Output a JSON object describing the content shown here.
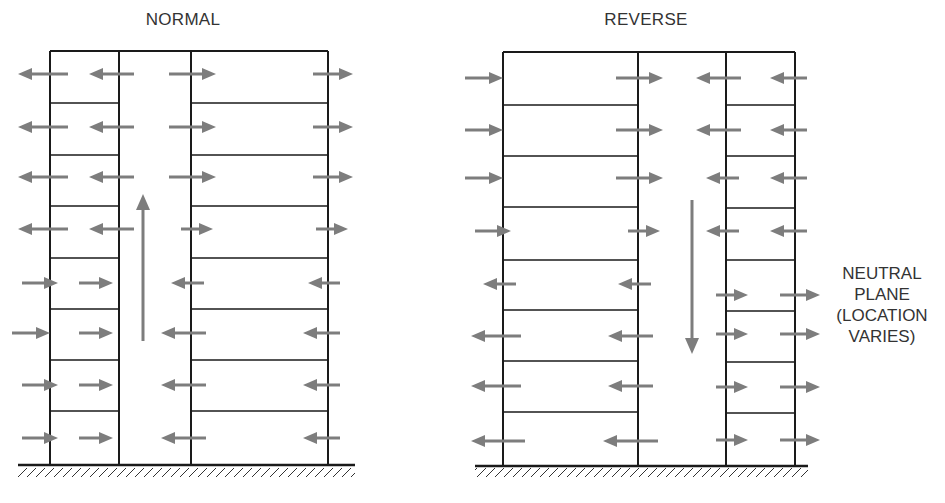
{
  "diagrams": [
    {
      "title": "NORMAL",
      "title_x": 183,
      "title_y": 10,
      "top": 51,
      "ground": 465,
      "ground_x1": 18,
      "ground_x2": 355,
      "sections": [
        {
          "x1": 50,
          "x2": 119,
          "floors": [
            103,
            155,
            206,
            258,
            309,
            360,
            411
          ]
        },
        {
          "x1": 191,
          "x2": 328,
          "floors": [
            103,
            155,
            206,
            258,
            309,
            360,
            411
          ]
        }
      ],
      "top_span": [
        50,
        328
      ],
      "shaft_arrow": {
        "x": 143,
        "y_from": 341,
        "y_to": 194,
        "direction": "up"
      },
      "arrows": [
        {
          "y": 74,
          "wx": 50,
          "dir": "out-left"
        },
        {
          "y": 74,
          "wx": 119,
          "dir": "left"
        },
        {
          "y": 74,
          "wx": 191,
          "dir": "right"
        },
        {
          "y": 74,
          "wx": 328,
          "dir": "out-right"
        },
        {
          "y": 127,
          "wx": 50,
          "dir": "out-left"
        },
        {
          "y": 127,
          "wx": 119,
          "dir": "left"
        },
        {
          "y": 127,
          "wx": 191,
          "dir": "right"
        },
        {
          "y": 127,
          "wx": 328,
          "dir": "out-right"
        },
        {
          "y": 177,
          "wx": 50,
          "dir": "out-left"
        },
        {
          "y": 177,
          "wx": 119,
          "dir": "left"
        },
        {
          "y": 177,
          "wx": 191,
          "dir": "right"
        },
        {
          "y": 177,
          "wx": 328,
          "dir": "out-right"
        },
        {
          "y": 229,
          "wx": 50,
          "dir": "out-left"
        },
        {
          "y": 229,
          "wx": 119,
          "dir": "left"
        },
        {
          "y": 229,
          "wx": 191,
          "dir": "right-short"
        },
        {
          "y": 229,
          "wx": 328,
          "dir": "out-right-short"
        },
        {
          "y": 283,
          "wx": 50,
          "dir": "in-right-short"
        },
        {
          "y": 283,
          "wx": 119,
          "dir": "in-right-inner"
        },
        {
          "y": 283,
          "wx": 191,
          "dir": "left-short"
        },
        {
          "y": 283,
          "wx": 328,
          "dir": "in-left-short"
        },
        {
          "y": 333,
          "wx": 50,
          "dir": "in-right"
        },
        {
          "y": 333,
          "wx": 119,
          "dir": "in-right-inner"
        },
        {
          "y": 333,
          "wx": 191,
          "dir": "left"
        },
        {
          "y": 333,
          "wx": 328,
          "dir": "in-left"
        },
        {
          "y": 385,
          "wx": 50,
          "dir": "in-right-short"
        },
        {
          "y": 385,
          "wx": 119,
          "dir": "in-right-inner"
        },
        {
          "y": 385,
          "wx": 191,
          "dir": "left"
        },
        {
          "y": 385,
          "wx": 328,
          "dir": "in-left"
        },
        {
          "y": 438,
          "wx": 50,
          "dir": "in-right-short"
        },
        {
          "y": 438,
          "wx": 119,
          "dir": "in-right-inner"
        },
        {
          "y": 438,
          "wx": 191,
          "dir": "left"
        },
        {
          "y": 438,
          "wx": 328,
          "dir": "in-left"
        }
      ]
    },
    {
      "title": "REVERSE",
      "title_x": 646,
      "title_y": 10,
      "top": 52,
      "ground": 466,
      "ground_x1": 475,
      "ground_x2": 808,
      "sections": [
        {
          "x1": 503,
          "x2": 638,
          "floors": [
            105,
            156,
            207,
            260,
            310,
            361,
            412
          ]
        },
        {
          "x1": 726,
          "x2": 795,
          "floors": [
            105,
            156,
            208,
            260,
            311,
            362,
            413
          ]
        }
      ],
      "top_span": [
        503,
        795
      ],
      "shaft_arrow": {
        "x": 692,
        "y_from": 200,
        "y_to": 354,
        "direction": "down"
      },
      "arrows": [
        {
          "y": 78,
          "wx": 503,
          "dir": "in-right"
        },
        {
          "y": 78,
          "wx": 638,
          "dir": "right"
        },
        {
          "y": 78,
          "wx": 726,
          "dir": "left"
        },
        {
          "y": 78,
          "wx": 795,
          "dir": "in-left"
        },
        {
          "y": 130,
          "wx": 503,
          "dir": "in-right"
        },
        {
          "y": 130,
          "wx": 638,
          "dir": "right"
        },
        {
          "y": 130,
          "wx": 726,
          "dir": "left"
        },
        {
          "y": 130,
          "wx": 795,
          "dir": "in-left"
        },
        {
          "y": 178,
          "wx": 503,
          "dir": "in-right"
        },
        {
          "y": 178,
          "wx": 638,
          "dir": "right"
        },
        {
          "y": 178,
          "wx": 726,
          "dir": "left-short"
        },
        {
          "y": 178,
          "wx": 795,
          "dir": "in-left"
        },
        {
          "y": 231,
          "wx": 503,
          "dir": "in-right-short"
        },
        {
          "y": 231,
          "wx": 638,
          "dir": "right-short"
        },
        {
          "y": 231,
          "wx": 726,
          "dir": "left-short"
        },
        {
          "y": 231,
          "wx": 795,
          "dir": "in-left"
        },
        {
          "y": 284,
          "wx": 503,
          "dir": "out-left-short"
        },
        {
          "y": 284,
          "wx": 638,
          "dir": "left-short"
        },
        {
          "y": 295,
          "wx": 726,
          "dir": "right-short"
        },
        {
          "y": 295,
          "wx": 795,
          "dir": "out-right"
        },
        {
          "y": 336,
          "wx": 503,
          "dir": "out-left"
        },
        {
          "y": 336,
          "wx": 638,
          "dir": "left"
        },
        {
          "y": 334,
          "wx": 726,
          "dir": "right-short"
        },
        {
          "y": 334,
          "wx": 795,
          "dir": "out-right"
        },
        {
          "y": 386,
          "wx": 503,
          "dir": "out-left"
        },
        {
          "y": 386,
          "wx": 638,
          "dir": "left"
        },
        {
          "y": 387,
          "wx": 726,
          "dir": "right-short"
        },
        {
          "y": 387,
          "wx": 795,
          "dir": "out-right"
        },
        {
          "y": 441,
          "wx": 503,
          "dir": "out-left-long"
        },
        {
          "y": 441,
          "wx": 638,
          "dir": "left-long"
        },
        {
          "y": 440,
          "wx": 726,
          "dir": "right-short"
        },
        {
          "y": 440,
          "wx": 795,
          "dir": "out-right"
        }
      ]
    }
  ],
  "neutral_plane_label": {
    "lines": [
      "NEUTRAL",
      "PLANE",
      "(LOCATION",
      "VARIES)"
    ],
    "x": 882,
    "y": 262
  },
  "colors": {
    "wall": "#1a1a1a",
    "arrow": "#7d7d7d",
    "text": "#333333"
  }
}
